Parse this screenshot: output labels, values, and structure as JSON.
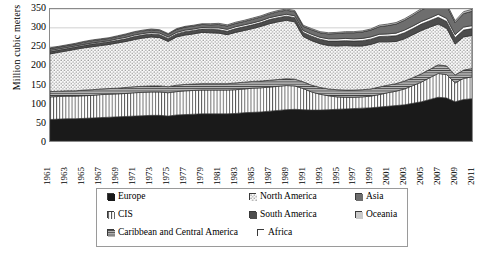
{
  "chart_data": {
    "type": "area",
    "title": "",
    "subtitle": "",
    "xlabel": "",
    "ylabel": "Million cubic meters",
    "ylim": [
      0,
      350
    ],
    "ytick_values": [
      0,
      50,
      100,
      150,
      200,
      250,
      300,
      350
    ],
    "grid": true,
    "legend_position": "bottom",
    "stacked": true,
    "x": [
      1961,
      1962,
      1963,
      1964,
      1965,
      1966,
      1967,
      1968,
      1969,
      1970,
      1971,
      1972,
      1973,
      1974,
      1975,
      1976,
      1977,
      1978,
      1979,
      1980,
      1981,
      1982,
      1983,
      1984,
      1985,
      1986,
      1987,
      1988,
      1989,
      1990,
      1991,
      1992,
      1993,
      1994,
      1995,
      1996,
      1997,
      1998,
      1999,
      2000,
      2001,
      2002,
      2003,
      2004,
      2005,
      2006,
      2007,
      2008,
      2009,
      2010,
      2011
    ],
    "xtick_labels": [
      "1961",
      "1963",
      "1965",
      "1967",
      "1969",
      "1971",
      "1973",
      "1975",
      "1977",
      "1979",
      "1981",
      "1983",
      "1985",
      "1987",
      "1989",
      "1991",
      "1993",
      "1995",
      "1997",
      "1999",
      "2001",
      "2003",
      "2005",
      "2007",
      "2009",
      "2011"
    ],
    "series": [
      {
        "name": "Europe",
        "pattern": "solid-black",
        "color": "#1a1a1a",
        "values": [
          57,
          58,
          59,
          59,
          60,
          61,
          62,
          63,
          64,
          65,
          66,
          67,
          68,
          68,
          66,
          69,
          70,
          71,
          72,
          72,
          72,
          72,
          73,
          75,
          76,
          77,
          79,
          81,
          83,
          84,
          83,
          82,
          82,
          83,
          84,
          85,
          86,
          87,
          88,
          90,
          92,
          94,
          96,
          100,
          104,
          110,
          116,
          114,
          104,
          110,
          112
        ]
      },
      {
        "name": "CIS",
        "pattern": "vertical-stripe",
        "color": "#ffffff",
        "values": [
          60,
          60,
          60,
          60,
          60,
          60,
          61,
          61,
          61,
          61,
          62,
          62,
          62,
          62,
          62,
          62,
          63,
          63,
          63,
          63,
          63,
          63,
          63,
          63,
          64,
          64,
          64,
          64,
          64,
          62,
          56,
          48,
          42,
          37,
          33,
          31,
          30,
          30,
          31,
          33,
          36,
          38,
          42,
          47,
          52,
          58,
          63,
          62,
          50,
          56,
          58
        ]
      },
      {
        "name": "Caribbean and Central America",
        "pattern": "horizontal-lines",
        "color": "#9c9c9c",
        "values": [
          14,
          14,
          14,
          14,
          15,
          15,
          15,
          15,
          15,
          16,
          16,
          16,
          16,
          16,
          16,
          17,
          17,
          17,
          17,
          17,
          17,
          17,
          18,
          18,
          18,
          18,
          18,
          18,
          18,
          18,
          18,
          18,
          18,
          18,
          19,
          19,
          19,
          19,
          19,
          20,
          20,
          20,
          21,
          21,
          22,
          22,
          23,
          23,
          21,
          22,
          22
        ]
      },
      {
        "name": "North America",
        "pattern": "dotted",
        "color": "#f2f2f2",
        "values": [
          100,
          103,
          106,
          110,
          112,
          114,
          115,
          117,
          120,
          122,
          125,
          128,
          130,
          128,
          120,
          128,
          131,
          133,
          136,
          135,
          134,
          130,
          134,
          137,
          140,
          145,
          150,
          153,
          155,
          152,
          120,
          118,
          116,
          115,
          116,
          118,
          117,
          116,
          118,
          120,
          115,
          112,
          112,
          114,
          115,
          112,
          108,
          100,
          82,
          88,
          88
        ]
      },
      {
        "name": "South America",
        "pattern": "dark-gray",
        "color": "#4d4d4d",
        "values": [
          6,
          6,
          6,
          6,
          6,
          7,
          7,
          7,
          7,
          7,
          8,
          8,
          8,
          8,
          8,
          8,
          9,
          9,
          9,
          9,
          9,
          9,
          10,
          10,
          10,
          10,
          11,
          11,
          11,
          11,
          11,
          12,
          12,
          12,
          13,
          13,
          13,
          14,
          14,
          14,
          15,
          15,
          16,
          16,
          17,
          17,
          18,
          18,
          17,
          18,
          18
        ]
      },
      {
        "name": "Africa",
        "pattern": "white-outline",
        "color": "#ffffff",
        "values": [
          3,
          3,
          3,
          3,
          3,
          3,
          3,
          3,
          4,
          4,
          4,
          4,
          4,
          4,
          4,
          4,
          4,
          4,
          4,
          4,
          5,
          5,
          5,
          5,
          5,
          5,
          5,
          5,
          5,
          5,
          5,
          5,
          5,
          6,
          6,
          6,
          6,
          6,
          6,
          6,
          6,
          7,
          7,
          7,
          7,
          7,
          8,
          8,
          8,
          8,
          8
        ]
      },
      {
        "name": "Asia",
        "pattern": "mid-gray",
        "color": "#6e6e6e",
        "values": [
          5,
          5,
          5,
          5,
          6,
          6,
          6,
          6,
          6,
          7,
          7,
          7,
          7,
          7,
          7,
          8,
          8,
          8,
          8,
          8,
          9,
          9,
          9,
          9,
          10,
          10,
          10,
          11,
          11,
          11,
          11,
          12,
          12,
          13,
          14,
          15,
          16,
          17,
          18,
          20,
          22,
          24,
          26,
          28,
          30,
          32,
          34,
          34,
          32,
          36,
          38
        ]
      },
      {
        "name": "Oceania",
        "pattern": "light-gray",
        "color": "#c4c4c4",
        "values": [
          2,
          2,
          2,
          2,
          2,
          2,
          2,
          2,
          2,
          2,
          2,
          2,
          2,
          2,
          2,
          2,
          2,
          2,
          2,
          3,
          3,
          3,
          3,
          3,
          3,
          3,
          3,
          3,
          3,
          3,
          3,
          3,
          3,
          3,
          3,
          3,
          3,
          3,
          3,
          4,
          4,
          4,
          4,
          4,
          4,
          4,
          5,
          5,
          5,
          5,
          5
        ]
      }
    ]
  },
  "axis": {
    "ylabel": "Million cubic meters",
    "yticks": [
      "350",
      "300",
      "250",
      "200",
      "150",
      "100",
      "50",
      "0"
    ]
  },
  "legend": {
    "items": [
      {
        "label": "Europe",
        "pattern": "solid-black",
        "row": 0,
        "col": 0
      },
      {
        "label": "North America",
        "pattern": "dotted",
        "row": 0,
        "col": 1
      },
      {
        "label": "Asia",
        "pattern": "mid-gray",
        "row": 0,
        "col": 2
      },
      {
        "label": "CIS",
        "pattern": "vertical-stripe",
        "row": 1,
        "col": 0
      },
      {
        "label": "South America",
        "pattern": "dark-gray",
        "row": 1,
        "col": 1
      },
      {
        "label": "Oceania",
        "pattern": "light-gray",
        "row": 1,
        "col": 2
      },
      {
        "label": "Caribbean and Central America",
        "pattern": "horizontal-lines",
        "row": 2,
        "col": 0
      },
      {
        "label": "Africa",
        "pattern": "white-outline",
        "row": 2,
        "col": 3
      }
    ]
  }
}
